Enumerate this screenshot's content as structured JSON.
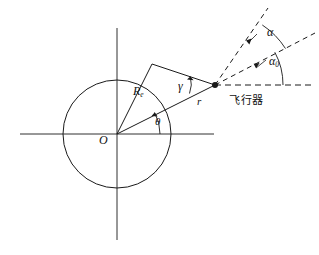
{
  "figure": {
    "type": "geometry-diagram",
    "background_color": "#ffffff",
    "stroke_color": "#1a1a1a"
  },
  "labels": {
    "earth_radius": "R",
    "earth_radius_sub": "e",
    "gamma": "γ",
    "range": "r",
    "theta": "θ",
    "origin": "O",
    "alpha": "α",
    "alpha0": "α",
    "alpha0_sub": "0",
    "vehicle": "飞行器"
  },
  "geometry": {
    "origin": {
      "x": 117,
      "y": 134
    },
    "circle_radius": 54,
    "vehicle_point": {
      "x": 215,
      "y": 85
    },
    "tangent_point": {
      "x": 152,
      "y": 64
    },
    "axis_horizontal": {
      "x1": 20,
      "y1": 134,
      "x2": 214,
      "y2": 134
    },
    "axis_vertical": {
      "x1": 117,
      "y1": 28,
      "x2": 117,
      "y2": 240
    },
    "dashed_rays": [
      {
        "name": "horizontal-reference",
        "x2": 315,
        "y2": 85
      },
      {
        "name": "alpha0-ray",
        "x2": 315,
        "y2": 33
      },
      {
        "name": "alpha-ray",
        "x2": 268,
        "y2": 8
      }
    ],
    "angles": [
      {
        "name": "theta",
        "vertex": "origin",
        "label": "θ"
      },
      {
        "name": "gamma",
        "vertex": "vehicle",
        "label": "γ"
      },
      {
        "name": "alpha",
        "vertex": "vehicle",
        "label": "α"
      },
      {
        "name": "alpha0",
        "vertex": "vehicle",
        "label": "α0"
      }
    ]
  }
}
